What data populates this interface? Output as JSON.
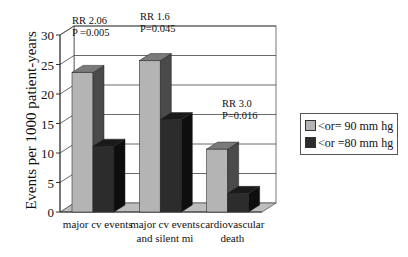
{
  "chart_data": {
    "type": "bar",
    "title": "",
    "xlabel": "",
    "ylabel": "Events per 1000 patient-years",
    "ylim": [
      0,
      30
    ],
    "yticks": [
      0,
      5,
      10,
      15,
      20,
      25,
      30
    ],
    "grid": true,
    "style": "3d-clustered-column",
    "legend_position": "right",
    "categories": [
      "major cv events",
      "major cv events and silent mi",
      "cardiovascular death"
    ],
    "category_lines": [
      [
        "major cv events"
      ],
      [
        "major cv events",
        "and silent mi"
      ],
      [
        "cardiovascular",
        "death"
      ]
    ],
    "series": [
      {
        "name": "<or= 90 mm hg",
        "color": "#b4b4b4",
        "values": [
          24,
          26,
          11
        ]
      },
      {
        "name": "<or =80 mm hg",
        "color": "#2c2c2c",
        "values": [
          11.5,
          16,
          3.5
        ]
      }
    ],
    "annotations": [
      {
        "category": "major cv events",
        "lines": [
          "RR 2.06",
          "P =0.005"
        ]
      },
      {
        "category": "major cv events and silent mi",
        "lines": [
          "RR 1.6",
          "P=0.045"
        ]
      },
      {
        "category": "cardiovascular death",
        "lines": [
          "RR 3.0",
          "P=0.016"
        ]
      }
    ]
  }
}
